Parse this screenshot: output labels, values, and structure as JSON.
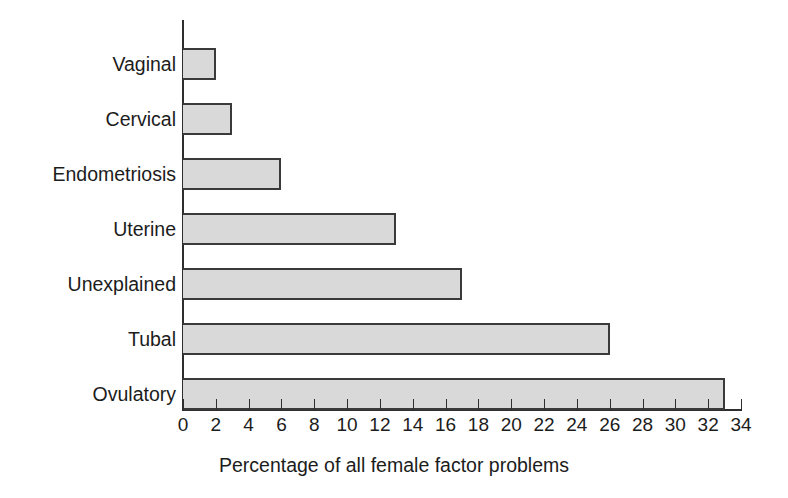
{
  "chart_data": {
    "type": "bar",
    "orientation": "horizontal",
    "title": "",
    "subtitle": "",
    "xlabel": "Percentage of all female factor problems",
    "ylabel": "",
    "categories": [
      "Ovulatory",
      "Tubal",
      "Unexplained",
      "Uterine",
      "Endometriosis",
      "Cervical",
      "Vaginal"
    ],
    "values": [
      33,
      26,
      17,
      13,
      6,
      3,
      2
    ],
    "series": [
      {
        "name": "Percentage of all female factor problems",
        "values": [
          33,
          26,
          17,
          13,
          6,
          3,
          2
        ]
      }
    ],
    "xlim": [
      0,
      34
    ],
    "xticks": [
      0,
      2,
      4,
      6,
      8,
      10,
      12,
      14,
      16,
      18,
      20,
      22,
      24,
      26,
      28,
      30,
      32,
      34
    ],
    "xtick_labels": [
      "0",
      "2",
      "4",
      "6",
      "8",
      "10",
      "12",
      "14",
      "16",
      "18",
      "20",
      "22",
      "24",
      "26",
      "28",
      "30",
      "32",
      "34"
    ],
    "grid": false,
    "legend": false,
    "legend_position": "none",
    "bar_fill_color": "#d9d9d9",
    "bar_border_color": "#3a3a3a",
    "background_color": "#ffffff",
    "axis_color": "#2e2e2e",
    "text_color": "#1c1c1c",
    "bars_top_to_bottom": [
      {
        "label": "Vaginal",
        "value": 2
      },
      {
        "label": "Cervical",
        "value": 3
      },
      {
        "label": "Endometriosis",
        "value": 6
      },
      {
        "label": "Uterine",
        "value": 13
      },
      {
        "label": "Unexplained",
        "value": 17
      },
      {
        "label": "Tubal",
        "value": 26
      },
      {
        "label": "Ovulatory",
        "value": 33
      }
    ]
  }
}
